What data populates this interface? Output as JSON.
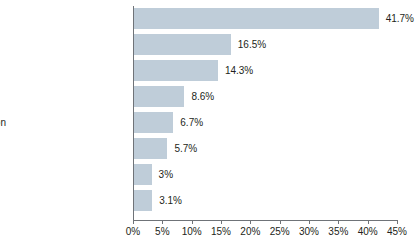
{
  "chart_data": {
    "type": "bar",
    "orientation": "horizontal",
    "title": "",
    "subtitle": "",
    "xlabel": "",
    "ylabel": "",
    "xlim": [
      0,
      45
    ],
    "grid": false,
    "legend": false,
    "categories": [
      "Housing",
      "Transportation",
      "Food and beverage",
      "Medical care",
      "Education and communication",
      "Recreation",
      "Apparel",
      "Other goods and services"
    ],
    "values": [
      41.7,
      16.5,
      14.3,
      8.6,
      6.7,
      5.7,
      3.0,
      3.1
    ],
    "value_labels": [
      "41.7%",
      "16.5%",
      "14.3%",
      "8.6%",
      "6.7%",
      "5.7%",
      "3%",
      "3.1%"
    ],
    "xticks": [
      0,
      5,
      10,
      15,
      20,
      25,
      30,
      35,
      40,
      45
    ],
    "xtick_labels": [
      "0%",
      "5%",
      "10%",
      "15%",
      "20%",
      "25%",
      "30%",
      "35%",
      "40%",
      "45%"
    ],
    "bar_color": "#bfcdd9",
    "axis_color": "#6f7378",
    "text_color": "#231f20"
  }
}
